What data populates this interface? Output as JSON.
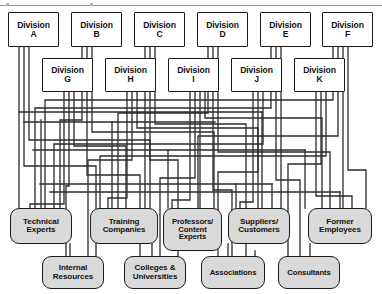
{
  "diagram": {
    "type": "network-matrix",
    "style": {
      "box_fill": "#ffffff",
      "resource_fill": "#d9d9d9",
      "stroke": "#1a1a1a",
      "rule": "#9a9aa0",
      "background": "#ffffff"
    }
  },
  "divisions_top": [
    {
      "name": "division-a",
      "label": "Division\nA",
      "x": 8,
      "y": 12,
      "w": 51,
      "h": 35
    },
    {
      "name": "division-b",
      "label": "Division\nB",
      "x": 71,
      "y": 12,
      "w": 51,
      "h": 35
    },
    {
      "name": "division-c",
      "label": "Division\nC",
      "x": 134,
      "y": 12,
      "w": 51,
      "h": 35
    },
    {
      "name": "division-d",
      "label": "Division\nD",
      "x": 197,
      "y": 12,
      "w": 51,
      "h": 35
    },
    {
      "name": "division-e",
      "label": "Division\nE",
      "x": 260,
      "y": 12,
      "w": 51,
      "h": 35
    },
    {
      "name": "division-f",
      "label": "Division\nF",
      "x": 322,
      "y": 12,
      "w": 51,
      "h": 35
    }
  ],
  "divisions_second": [
    {
      "name": "division-g",
      "label": "Division\nG",
      "x": 42,
      "y": 58,
      "w": 51,
      "h": 34
    },
    {
      "name": "division-h",
      "label": "Division\nH",
      "x": 105,
      "y": 58,
      "w": 51,
      "h": 34
    },
    {
      "name": "division-i",
      "label": "Division\nI",
      "x": 168,
      "y": 58,
      "w": 51,
      "h": 34
    },
    {
      "name": "division-j",
      "label": "Division\nJ",
      "x": 231,
      "y": 58,
      "w": 51,
      "h": 34
    },
    {
      "name": "division-k",
      "label": "Division\nK",
      "x": 294,
      "y": 58,
      "w": 51,
      "h": 34
    }
  ],
  "resources_row1": [
    {
      "name": "technical-experts",
      "label": "Technical\nExperts",
      "x": 10,
      "y": 208,
      "w": 62,
      "h": 36
    },
    {
      "name": "training-companies",
      "label": "Training\nCompanies",
      "x": 90,
      "y": 208,
      "w": 68,
      "h": 36
    },
    {
      "name": "professors-content-experts",
      "label": "Professors/\nContent\nExperts",
      "x": 163,
      "y": 208,
      "w": 59,
      "h": 43
    },
    {
      "name": "suppliers-customers",
      "label": "Suppliers/\nCustomers",
      "x": 228,
      "y": 208,
      "w": 62,
      "h": 36
    },
    {
      "name": "former-employees",
      "label": "Former\nEmployees",
      "x": 308,
      "y": 208,
      "w": 64,
      "h": 36
    }
  ],
  "resources_row2": [
    {
      "name": "internal-resources",
      "label": "Internal\nResources",
      "x": 42,
      "y": 256,
      "w": 62,
      "h": 33
    },
    {
      "name": "colleges-universities",
      "label": "Colleges &\nUniversities",
      "x": 124,
      "y": 256,
      "w": 62,
      "h": 33
    },
    {
      "name": "associations",
      "label": "Associations",
      "x": 201,
      "y": 256,
      "w": 64,
      "h": 33
    },
    {
      "name": "consultants",
      "label": "Consultants",
      "x": 278,
      "y": 256,
      "w": 62,
      "h": 33
    }
  ],
  "connections": {
    "description": "Each division connects by orthogonal routed lines to several resource nodes.",
    "line_color": "#2b2b2b",
    "line_width": 1.3
  }
}
